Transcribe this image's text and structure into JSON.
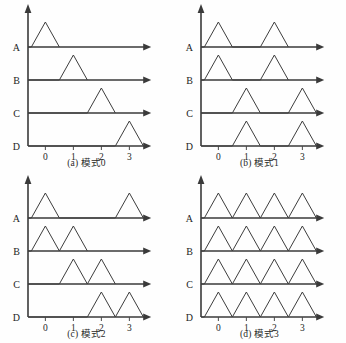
{
  "figure": {
    "panel_count": 4,
    "row_labels": [
      "A",
      "B",
      "C",
      "D"
    ],
    "tick_labels": [
      "0",
      "1",
      "2",
      "3"
    ],
    "colors": {
      "axis": "#3a3a3a",
      "wave": "#3d3d3d",
      "text": "#1d1d1d",
      "background": "#fefefe"
    }
  },
  "chart_data": {
    "type": "line",
    "xlabel": "",
    "ylabel": "",
    "grid": false,
    "legend": "none",
    "x_ticks": [
      0,
      1,
      2,
      3
    ],
    "x_tick_labels": [
      "0",
      "1",
      "2",
      "3"
    ],
    "xlim": [
      -0.6,
      3.7
    ],
    "channels": [
      "A",
      "B",
      "C",
      "D"
    ],
    "panels": [
      {
        "id": "a",
        "caption": "(a) 模式0",
        "label": "(a)",
        "mode": "模式0",
        "mode_number": 0,
        "series": [
          {
            "name": "A",
            "peaks": [
              0.0
            ],
            "start": -0.5,
            "end": 0.5
          },
          {
            "name": "B",
            "peaks": [
              1.0
            ],
            "start": 0.5,
            "end": 1.5
          },
          {
            "name": "C",
            "peaks": [
              2.0
            ],
            "start": 1.5,
            "end": 2.5
          },
          {
            "name": "D",
            "peaks": [
              3.0
            ],
            "start": 2.5,
            "end": 3.5
          }
        ]
      },
      {
        "id": "b",
        "caption": "(b) 模式1",
        "label": "(b)",
        "mode": "模式1",
        "mode_number": 1,
        "series": [
          {
            "name": "A",
            "peaks": [
              0.0,
              2.0
            ]
          },
          {
            "name": "B",
            "peaks": [
              0.0,
              2.0
            ]
          },
          {
            "name": "C",
            "peaks": [
              1.0,
              3.0
            ]
          },
          {
            "name": "D",
            "peaks": [
              1.0,
              3.0
            ]
          }
        ]
      },
      {
        "id": "c",
        "caption": "(c) 模式2",
        "label": "(c)",
        "mode": "模式2",
        "mode_number": 2,
        "series": [
          {
            "name": "A",
            "peaks": [
              0.0,
              3.0
            ]
          },
          {
            "name": "B",
            "peaks": [
              0.0,
              1.0
            ]
          },
          {
            "name": "C",
            "peaks": [
              1.0,
              2.0
            ]
          },
          {
            "name": "D",
            "peaks": [
              2.0,
              3.0
            ]
          }
        ]
      },
      {
        "id": "d",
        "caption": "(d) 模式3",
        "label": "(d)",
        "mode": "模式3",
        "mode_number": 3,
        "series": [
          {
            "name": "A",
            "peaks": [
              0.0,
              1.0,
              2.0,
              3.0
            ]
          },
          {
            "name": "B",
            "peaks": [
              0.0,
              1.0,
              2.0,
              3.0
            ]
          },
          {
            "name": "C",
            "peaks": [
              0.0,
              1.0,
              2.0,
              3.0
            ]
          },
          {
            "name": "D",
            "peaks": [
              0.0,
              1.0,
              2.0,
              3.0
            ]
          }
        ]
      }
    ]
  }
}
